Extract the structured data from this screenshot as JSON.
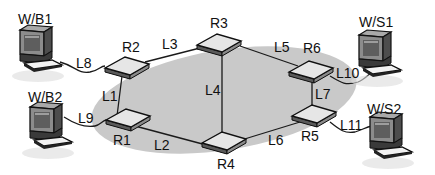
{
  "diagram": {
    "type": "network-topology",
    "colors": {
      "background": "#ffffff",
      "cloud": "#c9c9c9",
      "link": "#1a1a1a",
      "router_top": "#e6e6e6",
      "router_side": "#7a7a7a",
      "monitor_body": "#8c8c8c",
      "monitor_screen": "#5e5e5e",
      "keyboard": "#f2f2f2",
      "label": "#111111"
    },
    "routers": [
      {
        "id": "R1",
        "label": "R1"
      },
      {
        "id": "R2",
        "label": "R2"
      },
      {
        "id": "R3",
        "label": "R3"
      },
      {
        "id": "R4",
        "label": "R4"
      },
      {
        "id": "R5",
        "label": "R5"
      },
      {
        "id": "R6",
        "label": "R6"
      }
    ],
    "workstations": [
      {
        "id": "W/B1",
        "label": "W/B1"
      },
      {
        "id": "W/B2",
        "label": "W/B2"
      },
      {
        "id": "W/S1",
        "label": "W/S1"
      },
      {
        "id": "W/S2",
        "label": "W/S2"
      }
    ],
    "links": [
      {
        "id": "L1",
        "label": "L1",
        "from": "R1",
        "to": "R2"
      },
      {
        "id": "L2",
        "label": "L2",
        "from": "R1",
        "to": "R4"
      },
      {
        "id": "L3",
        "label": "L3",
        "from": "R2",
        "to": "R3"
      },
      {
        "id": "L4",
        "label": "L4",
        "from": "R3",
        "to": "R4"
      },
      {
        "id": "L5",
        "label": "L5",
        "from": "R3",
        "to": "R6"
      },
      {
        "id": "L6",
        "label": "L6",
        "from": "R4",
        "to": "R5"
      },
      {
        "id": "L7",
        "label": "L7",
        "from": "R5",
        "to": "R6"
      },
      {
        "id": "L8",
        "label": "L8",
        "from": "W/B1",
        "to": "R2"
      },
      {
        "id": "L9",
        "label": "L9",
        "from": "W/B2",
        "to": "R1"
      },
      {
        "id": "L10",
        "label": "L10",
        "from": "R6",
        "to": "W/S1"
      },
      {
        "id": "L11",
        "label": "L11",
        "from": "R5",
        "to": "W/S2"
      }
    ]
  }
}
